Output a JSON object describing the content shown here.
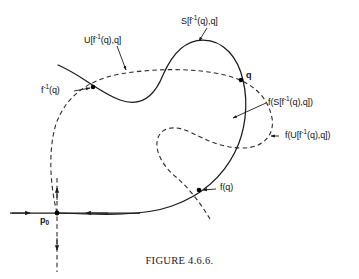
{
  "figure": {
    "caption": "FIGURE 4.6.6.",
    "background_color": "#ffffff",
    "stroke_color": "#1a1a1a",
    "dashed_stroke_color": "#2a2a2a"
  },
  "labels": {
    "s_segment": "S[f-1(q),q]",
    "u_segment": "U[f-1(q),q]",
    "f_inverse_q": "f-1(q)",
    "q": "q",
    "f_s_segment": "f(S[f-1(q),q])",
    "f_u_segment": "f(U[f-1(q),q])",
    "f_q": "f(q)",
    "p0": "p0"
  },
  "label_parts": {
    "s_segment": {
      "pre": "S[f",
      "sup": "-1",
      "post": "(q),q]"
    },
    "u_segment": {
      "pre": "U[f",
      "sup": "-1",
      "post": "(q),q]"
    },
    "f_inverse_q": {
      "pre": "f",
      "sup": "-1",
      "post": "(q)"
    },
    "f_s_segment": {
      "pre": "f(S[f",
      "sup": "-1",
      "post": "(q),q])"
    },
    "f_u_segment": {
      "pre": "f(U[f",
      "sup": "-1",
      "post": "(q),q])"
    },
    "f_q": {
      "pre": "f(q)",
      "sup": "",
      "post": ""
    },
    "q": {
      "pre": "q",
      "sup": "",
      "post": ""
    },
    "p0": {
      "pre": "p",
      "sub": "0",
      "post": ""
    }
  },
  "points": [
    {
      "name": "f-inverse-q-point",
      "x": 93,
      "y": 87
    },
    {
      "name": "q-point",
      "x": 241,
      "y": 80
    },
    {
      "name": "f-q-point",
      "x": 199,
      "y": 190
    },
    {
      "name": "p0-point",
      "x": 57,
      "y": 213
    }
  ],
  "geometry": {
    "stable_manifold_solid": "M 58 65 C 82 75, 98 92, 120 100 C 142 108, 155 95, 163 75 C 172 54, 185 40, 203 40 C 224 40, 238 58, 243 80 C 249 105, 245 132, 235 152 C 222 178, 200 196, 172 206 C 144 216, 105 215, 59 213",
    "unstable_manifold_dashed": "M 57 213 C 50 185, 48 150, 56 124 C 66 96, 88 80, 120 74 C 155 68, 195 68, 225 75 C 253 82, 268 97, 272 118 C 275 136, 262 148, 243 148 C 222 148, 206 140, 192 133 C 178 126, 166 126, 160 134 C 152 145, 160 164, 176 177 C 186 186, 196 196, 210 219",
    "horizontal_axis": "M 10 213 L 140 213",
    "vertical_axis_dashed": "M 57 180 L 57 272",
    "arrows": [
      {
        "name": "horizontal-left-arrow-outer",
        "x": 28,
        "y": 213,
        "dir": "left"
      },
      {
        "name": "horizontal-left-arrow-inner",
        "x": 87,
        "y": 213,
        "dir": "left"
      },
      {
        "name": "vertical-up-arrow",
        "x": 57,
        "y": 190,
        "dir": "up"
      },
      {
        "name": "vertical-down-arrow",
        "x": 57,
        "y": 248,
        "dir": "down"
      }
    ]
  },
  "label_positions": {
    "s_segment": {
      "left": 181,
      "top": 17
    },
    "u_segment": {
      "left": 84,
      "top": 36
    },
    "f_inverse_q": {
      "left": 41,
      "top": 89
    },
    "q": {
      "left": 246,
      "top": 73
    },
    "f_s_segment": {
      "left": 268,
      "top": 98
    },
    "f_u_segment": {
      "left": 281,
      "top": 132
    },
    "f_q": {
      "left": 218,
      "top": 183
    },
    "p0": {
      "left": 40,
      "top": 216
    }
  }
}
